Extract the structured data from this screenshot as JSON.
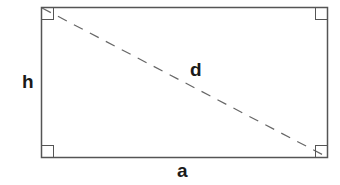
{
  "diagram": {
    "labels": {
      "height": "h",
      "diagonal": "d",
      "width": "a"
    },
    "colors": {
      "stroke": "#555555",
      "dash": "#666666",
      "text": "#1a1a1a",
      "background": "#ffffff"
    },
    "right_angle_markers": 4
  }
}
